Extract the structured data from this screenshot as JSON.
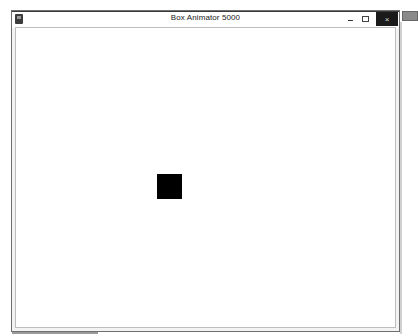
{
  "window": {
    "title": "Box Animator 5000",
    "icon": "app-icon",
    "controls": {
      "minimize": "minimize-icon",
      "maximize": "maximize-icon",
      "close": "×"
    }
  },
  "canvas": {
    "background": "#ffffff",
    "box": {
      "x": 157,
      "y": 174,
      "width": 25,
      "height": 25,
      "color": "#000000"
    }
  }
}
